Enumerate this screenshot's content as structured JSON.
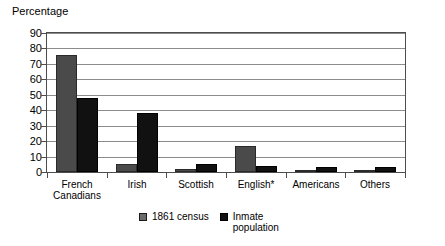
{
  "chart_data": {
    "type": "bar",
    "title": "",
    "ylabel": "Percentage",
    "xlabel": "",
    "ylim": [
      0,
      90
    ],
    "yticks": [
      0,
      10,
      20,
      30,
      40,
      50,
      60,
      70,
      80,
      90
    ],
    "grid": true,
    "legend_position": "bottom",
    "categories": [
      "French\nCanadians",
      "Irish",
      "Scottish",
      "English*",
      "Americans",
      "Others"
    ],
    "series": [
      {
        "name": "1861 census",
        "color": "#4a4a4a",
        "values": [
          76,
          5,
          2,
          17,
          1,
          1
        ]
      },
      {
        "name": "Inmate population",
        "color": "#111111",
        "values": [
          48,
          38,
          5,
          4,
          3,
          3
        ]
      }
    ]
  },
  "axis": {
    "y_title": "Percentage",
    "y_tick_labels": [
      "90",
      "80",
      "70",
      "60",
      "50",
      "40",
      "30",
      "20",
      "10",
      "0"
    ],
    "x_tick_labels": [
      {
        "line1": "French",
        "line2": "Canadians"
      },
      {
        "line1": "Irish",
        "line2": ""
      },
      {
        "line1": "Scottish",
        "line2": ""
      },
      {
        "line1": "English*",
        "line2": ""
      },
      {
        "line1": "Americans",
        "line2": ""
      },
      {
        "line1": "Others",
        "line2": ""
      }
    ]
  },
  "legend": {
    "entries": [
      {
        "label": "1861 census",
        "swatch": "census-swatch"
      },
      {
        "label": "Inmate\npopulation",
        "swatch": "inmate-swatch"
      }
    ]
  }
}
